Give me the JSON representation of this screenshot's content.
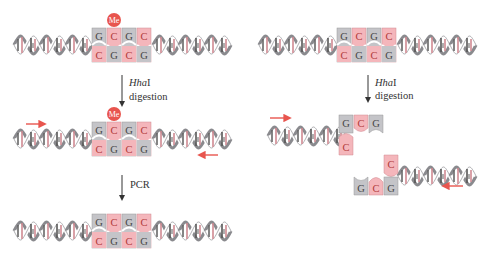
{
  "colors": {
    "pink": "#f4b6bb",
    "gray": "#c4c4c8",
    "red": "#e8554e",
    "arrow": "#333333",
    "helix_dark": "#6e6e72",
    "helix_pink": "#d9a3a8"
  },
  "left": {
    "panel1": {
      "top_bases": [
        "G",
        "C",
        "G",
        "C"
      ],
      "bottom_bases": [
        "C",
        "G",
        "C",
        "G"
      ],
      "methyl_label": "Me"
    },
    "step1": {
      "label_italic": "Hha",
      "label_roman": "I",
      "label2": "digestion"
    },
    "panel2": {
      "top_bases": [
        "G",
        "C",
        "G",
        "C"
      ],
      "bottom_bases": [
        "C",
        "G",
        "C",
        "G"
      ],
      "methyl_label": "Me"
    },
    "step2": {
      "label": "PCR"
    },
    "panel3": {
      "top_bases": [
        "G",
        "C",
        "G",
        "C"
      ],
      "bottom_bases": [
        "C",
        "G",
        "C",
        "G"
      ]
    }
  },
  "right": {
    "panel1": {
      "top_bases": [
        "G",
        "C",
        "G",
        "C"
      ],
      "bottom_bases": [
        "C",
        "G",
        "C",
        "G"
      ]
    },
    "step1": {
      "label_italic": "Hha",
      "label_roman": "I",
      "label2": "digestion"
    },
    "fragment1": {
      "top_bases": [
        "G",
        "C",
        "G"
      ],
      "bottom_bases": [
        "C"
      ]
    },
    "fragment2": {
      "top_bases": [
        "C"
      ],
      "bottom_bases": [
        "G",
        "C",
        "G"
      ]
    }
  }
}
